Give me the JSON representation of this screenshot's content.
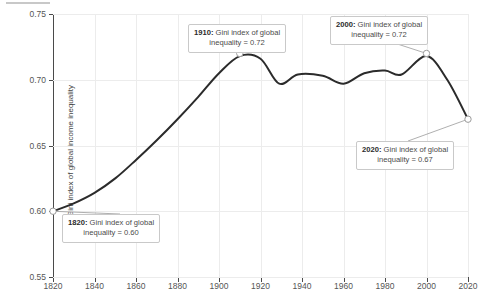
{
  "chart_data": {
    "type": "line",
    "title": "",
    "xlabel": "",
    "ylabel": "Gini index of global income inequality",
    "xlim": [
      1820,
      2020
    ],
    "ylim": [
      0.55,
      0.75
    ],
    "grid": true,
    "legend": "none",
    "xticks": [
      "1820",
      "1840",
      "1860",
      "1880",
      "1900",
      "1920",
      "1940",
      "1960",
      "1980",
      "2000",
      "2020"
    ],
    "yticks": [
      "0.55",
      "0.60",
      "0.65",
      "0.70",
      "0.75"
    ],
    "series": [
      {
        "name": "Gini index of global income inequality",
        "color": "#2b2b2b",
        "x": [
          1820,
          1830,
          1840,
          1850,
          1860,
          1870,
          1880,
          1890,
          1900,
          1910,
          1920,
          1929,
          1938,
          1950,
          1960,
          1970,
          1980,
          1988,
          2000,
          2010,
          2020
        ],
        "values": [
          0.6,
          0.606,
          0.614,
          0.625,
          0.639,
          0.654,
          0.67,
          0.687,
          0.705,
          0.718,
          0.716,
          0.697,
          0.704,
          0.703,
          0.697,
          0.705,
          0.707,
          0.704,
          0.718,
          0.7,
          0.67
        ]
      }
    ],
    "annotated_points": [
      {
        "year": 1820,
        "value": 0.6
      },
      {
        "year": 1910,
        "value": 0.72
      },
      {
        "year": 2000,
        "value": 0.72
      },
      {
        "year": 2020,
        "value": 0.67
      }
    ]
  },
  "annotations": {
    "a1820": {
      "year": "1820:",
      "text_line1": " Gini index of global",
      "text_line2": "inequality = 0.60"
    },
    "a1910": {
      "year": "1910:",
      "text_line1": " Gini index of global",
      "text_line2": "inequality = 0.72"
    },
    "a2000": {
      "year": "2000:",
      "text_line1": " Gini index of global",
      "text_line2": "inequality = 0.72"
    },
    "a2020": {
      "year": "2020:",
      "text_line1": " Gini index of global",
      "text_line2": "inequality = 0.67"
    }
  }
}
